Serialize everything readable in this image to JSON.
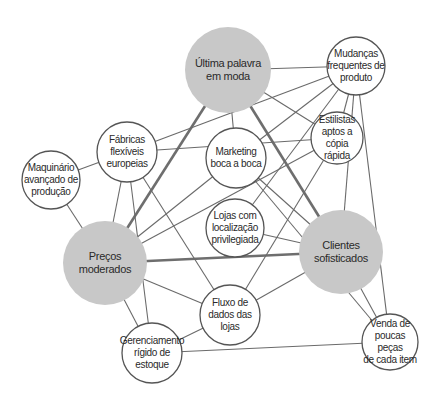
{
  "diagram": {
    "title": "",
    "colors": {
      "major_fill": "#c8c8c8",
      "minor_fill": "#ffffff",
      "stroke": "#555555",
      "thick_edge": "#6e6e6e",
      "edge": "#6a6a6a"
    },
    "nodes": [
      {
        "id": "ultima",
        "label": "Última palavra\nem moda",
        "x": 228,
        "y": 70,
        "r": 43,
        "major": true
      },
      {
        "id": "mudancas",
        "label": "Mudanças\nfrequentes de\nproduto",
        "x": 356,
        "y": 66,
        "r": 29,
        "major": false
      },
      {
        "id": "estilistas",
        "label": "Estilistas\naptos a cópia\nrápida",
        "x": 337,
        "y": 138,
        "r": 26,
        "major": false
      },
      {
        "id": "fabricas",
        "label": "Fábricas\nflexíveis\neuropeias",
        "x": 127,
        "y": 152,
        "r": 30,
        "major": false
      },
      {
        "id": "maquinario",
        "label": "Maquinário\navançado de\nprodução",
        "x": 51,
        "y": 180,
        "r": 29,
        "major": false
      },
      {
        "id": "marketing",
        "label": "Marketing\nboca a boca",
        "x": 236,
        "y": 158,
        "r": 30,
        "major": false
      },
      {
        "id": "lojas",
        "label": "Lojas com\nlocalização\nprivilegiada",
        "x": 235,
        "y": 228,
        "r": 29,
        "major": false
      },
      {
        "id": "precos",
        "label": "Preços\nmoderados",
        "x": 105,
        "y": 263,
        "r": 42,
        "major": true
      },
      {
        "id": "clientes",
        "label": "Clientes\nsofisticados",
        "x": 341,
        "y": 252,
        "r": 42,
        "major": true
      },
      {
        "id": "fluxo",
        "label": "Fluxo de\ndados das\nlojas",
        "x": 230,
        "y": 315,
        "r": 30,
        "major": false
      },
      {
        "id": "gerenciamento",
        "label": "Gerenciamento\nrígido de\nestoque",
        "x": 152,
        "y": 353,
        "r": 30,
        "major": false
      },
      {
        "id": "venda",
        "label": "Venda de\npoucas peças\nde cada item",
        "x": 390,
        "y": 342,
        "r": 28,
        "major": false
      }
    ],
    "edges": [
      {
        "from": "ultima",
        "to": "precos",
        "thick": true
      },
      {
        "from": "ultima",
        "to": "clientes",
        "thick": true
      },
      {
        "from": "precos",
        "to": "clientes",
        "thick": true
      },
      {
        "from": "ultima",
        "to": "mudancas",
        "thick": false
      },
      {
        "from": "ultima",
        "to": "marketing",
        "thick": false
      },
      {
        "from": "ultima",
        "to": "estilistas",
        "thick": false
      },
      {
        "from": "mudancas",
        "to": "fabricas",
        "thick": false
      },
      {
        "from": "estilistas",
        "to": "fabricas",
        "thick": false
      },
      {
        "from": "maquinario",
        "to": "fabricas",
        "thick": false
      },
      {
        "from": "maquinario",
        "to": "precos",
        "thick": false
      },
      {
        "from": "fabricas",
        "to": "precos",
        "thick": false
      },
      {
        "from": "fabricas",
        "to": "gerenciamento",
        "thick": false
      },
      {
        "from": "fabricas",
        "to": "fluxo",
        "thick": false
      },
      {
        "from": "marketing",
        "to": "precos",
        "thick": false
      },
      {
        "from": "estilistas",
        "to": "precos",
        "thick": false
      },
      {
        "from": "marketing",
        "to": "clientes",
        "thick": false
      },
      {
        "from": "marketing",
        "to": "venda",
        "thick": false
      },
      {
        "from": "mudancas",
        "to": "marketing",
        "thick": false
      },
      {
        "from": "mudancas",
        "to": "lojas",
        "thick": false
      },
      {
        "from": "mudancas",
        "to": "estilistas",
        "thick": false
      },
      {
        "from": "mudancas",
        "to": "clientes",
        "thick": false
      },
      {
        "from": "mudancas",
        "to": "venda",
        "thick": false
      },
      {
        "from": "lojas",
        "to": "clientes",
        "thick": false
      },
      {
        "from": "estilistas",
        "to": "fluxo",
        "thick": false
      },
      {
        "from": "precos",
        "to": "fluxo",
        "thick": false
      },
      {
        "from": "precos",
        "to": "gerenciamento",
        "thick": false
      },
      {
        "from": "fluxo",
        "to": "gerenciamento",
        "thick": false
      },
      {
        "from": "fluxo",
        "to": "clientes",
        "thick": false
      },
      {
        "from": "clientes",
        "to": "venda",
        "thick": false
      },
      {
        "from": "gerenciamento",
        "to": "venda",
        "thick": false
      }
    ]
  }
}
